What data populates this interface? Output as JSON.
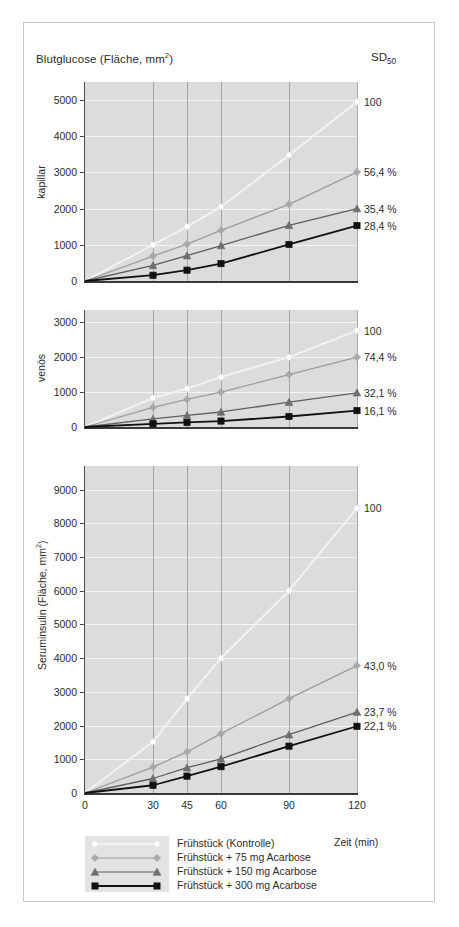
{
  "figure": {
    "sd_header": "SD50",
    "sd_header_main": "SD",
    "sd_header_sub": "50",
    "xaxis_title": "Zeit (min)"
  },
  "legend": {
    "items": [
      {
        "label": "Frühstück (Kontrolle)",
        "marker": "circle-marker",
        "color": "#ffffff",
        "line": "#f2f2f2"
      },
      {
        "label": "Frühstück +   75 mg Acarbose",
        "marker": "diamond-marker",
        "color": "#a8a8a8",
        "line": "#9c9c9c"
      },
      {
        "label": "Frühstück + 150 mg Acarbose",
        "marker": "triangle-marker",
        "color": "#6e6e6e",
        "line": "#5f5f5f"
      },
      {
        "label": "Frühstück + 300 mg Acarbose",
        "marker": "square-marker",
        "color": "#111111",
        "line": "#111111"
      }
    ]
  },
  "chart_data": [
    {
      "type": "line",
      "panel_id": "kapillar-panel",
      "title": "Blutglucose (Fläche, mm²)",
      "ylabel": "kapillar",
      "xlabel": "Zeit (min)",
      "right_label": "75 mg Acarbose",
      "x": [
        0,
        30,
        45,
        60,
        90,
        120
      ],
      "xticks": [
        "0",
        "30",
        "45",
        "60",
        "90",
        "120"
      ],
      "yticks": [
        "0",
        "1000",
        "2000",
        "3000",
        "4000",
        "5000"
      ],
      "ytickvals": [
        0,
        1000,
        2000,
        3000,
        4000,
        5000
      ],
      "ylim": [
        0,
        5500
      ],
      "xlim": [
        0,
        120
      ],
      "grid": true,
      "series": [
        {
          "name": "Frühstück (Kontrolle)",
          "values": [
            0,
            1000,
            1500,
            2050,
            3480,
            4950
          ],
          "sd50": "100"
        },
        {
          "name": "Frühstück +   75 mg Acarbose",
          "values": [
            0,
            690,
            1020,
            1400,
            2120,
            3010
          ],
          "sd50": "56,4 %"
        },
        {
          "name": "Frühstück + 150 mg Acarbose",
          "values": [
            0,
            430,
            700,
            980,
            1540,
            2000
          ],
          "sd50": "35,4 %"
        },
        {
          "name": "Frühstück + 300 mg Acarbose",
          "values": [
            0,
            160,
            300,
            480,
            1010,
            1530
          ],
          "sd50": "28,4 %"
        }
      ]
    },
    {
      "type": "line",
      "panel_id": "venoes-panel",
      "ylabel": "venös",
      "xlabel": "Zeit (min)",
      "right_label": "90 mg Acarbose",
      "x": [
        0,
        30,
        45,
        60,
        90,
        120
      ],
      "xticks": [
        "0",
        "30",
        "45",
        "60",
        "90",
        "120"
      ],
      "yticks": [
        "0",
        "1000",
        "2000",
        "3000"
      ],
      "ytickvals": [
        0,
        1000,
        2000,
        3000
      ],
      "ylim": [
        0,
        3350
      ],
      "xlim": [
        0,
        120
      ],
      "grid": true,
      "series": [
        {
          "name": "Frühstück (Kontrolle)",
          "values": [
            0,
            830,
            1100,
            1430,
            2000,
            2760
          ],
          "sd50": "100"
        },
        {
          "name": "Frühstück +   75 mg Acarbose",
          "values": [
            0,
            560,
            790,
            1000,
            1500,
            2000
          ],
          "sd50": "74,4 %"
        },
        {
          "name": "Frühstück + 150 mg Acarbose",
          "values": [
            0,
            230,
            330,
            430,
            710,
            980
          ],
          "sd50": "32,1 %"
        },
        {
          "name": "Frühstück + 300 mg Acarbose",
          "values": [
            0,
            90,
            130,
            170,
            300,
            470
          ],
          "sd50": "16,1 %"
        }
      ]
    },
    {
      "type": "line",
      "panel_id": "seruminsulin-panel",
      "ylabel": "Seruminsulin (Fläche, mm²)",
      "xlabel": "Zeit (min)",
      "right_label": "62 mg Acarbose",
      "x": [
        0,
        30,
        45,
        60,
        90,
        120
      ],
      "xticks": [
        "0",
        "30",
        "45",
        "60",
        "90",
        "120"
      ],
      "yticks": [
        "0",
        "1000",
        "2000",
        "3000",
        "4000",
        "5000",
        "6000",
        "7000",
        "8000",
        "9000"
      ],
      "ytickvals": [
        0,
        1000,
        2000,
        3000,
        4000,
        5000,
        6000,
        7000,
        8000,
        9000
      ],
      "ylim": [
        0,
        9700
      ],
      "xlim": [
        0,
        120
      ],
      "grid": true,
      "series": [
        {
          "name": "Frühstück (Kontrolle)",
          "values": [
            0,
            1520,
            2800,
            4000,
            6000,
            8450
          ],
          "sd50": "100"
        },
        {
          "name": "Frühstück +   75 mg Acarbose",
          "values": [
            0,
            770,
            1220,
            1760,
            2800,
            3780
          ],
          "sd50": "43,0 %"
        },
        {
          "name": "Frühstück + 150 mg Acarbose",
          "values": [
            0,
            430,
            750,
            1010,
            1730,
            2400
          ],
          "sd50": "23,7 %"
        },
        {
          "name": "Frühstück + 300 mg Acarbose",
          "values": [
            0,
            230,
            500,
            780,
            1390,
            1980
          ],
          "sd50": "22,1 %"
        }
      ]
    }
  ],
  "layout": {
    "panels": [
      {
        "plot_left": 85,
        "plot_top": 82,
        "plot_width": 272,
        "plot_height": 199,
        "ylabel_center_y": 182
      },
      {
        "plot_left": 85,
        "plot_top": 310,
        "plot_width": 272,
        "plot_height": 117,
        "ylabel_center_y": 368
      },
      {
        "plot_left": 85,
        "plot_top": 466,
        "plot_width": 272,
        "plot_height": 327,
        "ylabel_center_y": 630
      }
    ],
    "colors": {
      "plot_background": "#dcdcdc",
      "gridline_h": "#f4f4f4",
      "gridline_v": "#9a9a9a",
      "axis": "#4a4a4a",
      "frame": "#c9c9c9"
    }
  }
}
